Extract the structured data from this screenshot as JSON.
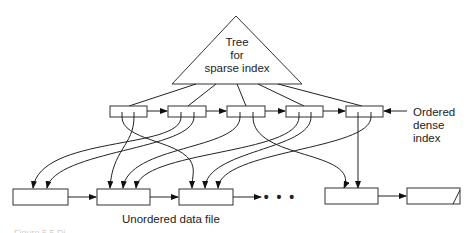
{
  "diagram": {
    "tree_label": [
      "Tree",
      "for",
      "sparse index"
    ],
    "dense_index_label": [
      "Ordered",
      "dense",
      "index"
    ],
    "data_file_label": "Unordered data file",
    "ellipsis": "• • •",
    "caption": "Figure 5.5  Di",
    "dense_index_entries": 5,
    "data_blocks": 5
  }
}
